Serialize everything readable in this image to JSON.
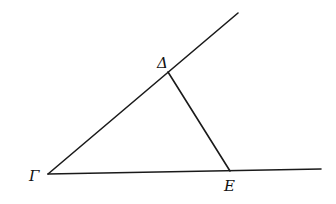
{
  "diagram": {
    "type": "geometric-figure",
    "points": {
      "gamma": {
        "label": "Γ",
        "x": 48,
        "y": 174,
        "label_x": 29,
        "label_y": 181
      },
      "delta": {
        "label": "Δ",
        "x": 168,
        "y": 72,
        "label_x": 157,
        "label_y": 68
      },
      "epsilon": {
        "label": "E",
        "x": 230,
        "y": 171,
        "label_x": 224,
        "label_y": 191
      }
    },
    "segments": [
      {
        "name": "ray-gamma-delta-extended",
        "from": [
          48,
          174
        ],
        "to": [
          238,
          13
        ]
      },
      {
        "name": "ray-gamma-epsilon-extended",
        "from": [
          48,
          174
        ],
        "to": [
          321,
          169
        ]
      },
      {
        "name": "segment-delta-epsilon",
        "from": [
          168,
          72
        ],
        "to": [
          230,
          171
        ]
      }
    ],
    "colors": {
      "stroke": "#1a1a1a",
      "background": "#ffffff"
    }
  }
}
